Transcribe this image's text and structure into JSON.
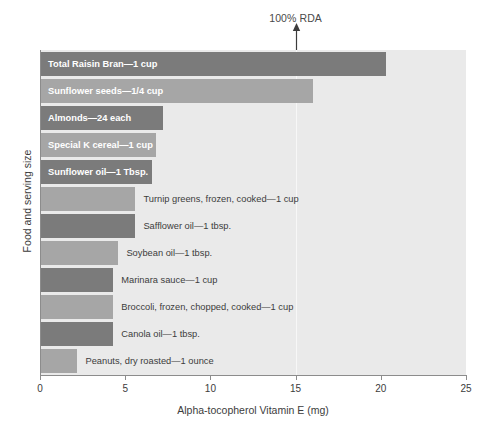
{
  "chart_data": {
    "type": "bar",
    "orientation": "horizontal",
    "title": "",
    "xlabel": "Alpha-tocopherol Vitamin E (mg)",
    "ylabel": "Food and serving size",
    "xlim": [
      0,
      25
    ],
    "xticks": [
      0,
      5,
      10,
      15,
      20,
      25
    ],
    "xtick_labels": [
      "0",
      "5",
      "10",
      "15",
      "20",
      "25"
    ],
    "grid": false,
    "legend": null,
    "annotations": [
      {
        "name": "rda-marker",
        "label": "100% RDA",
        "x": 15,
        "type": "arrow-up-with-reference-line"
      }
    ],
    "categories": [
      "Total Raisin Bran—1 cup",
      "Sunflower seeds—1/4 cup",
      "Almonds—24 each",
      "Special K cereal—1 cup",
      "Sunflower oil—1 Tbsp.",
      "Turnip greens, frozen, cooked—1 cup",
      "Safflower oil—1 tbsp.",
      "Soybean oil—1 tbsp.",
      "Marinara sauce—1 cup",
      "Broccoli, frozen, chopped, cooked—1 cup",
      "Canola oil—1 tbsp.",
      "Peanuts, dry roasted—1 ounce"
    ],
    "values": [
      20.3,
      16.0,
      7.2,
      6.8,
      6.6,
      5.6,
      5.6,
      4.6,
      4.3,
      4.3,
      4.3,
      2.2
    ],
    "bars": [
      {
        "label": "Total Raisin Bran—1 cup",
        "value": 20.3,
        "color": "#7b7b7b",
        "label_position": "inside"
      },
      {
        "label": "Sunflower seeds—1/4 cup",
        "value": 16.0,
        "color": "#a6a6a6",
        "label_position": "inside"
      },
      {
        "label": "Almonds—24 each",
        "value": 7.2,
        "color": "#7b7b7b",
        "label_position": "inside"
      },
      {
        "label": "Special K cereal—1 cup",
        "value": 6.8,
        "color": "#a6a6a6",
        "label_position": "inside"
      },
      {
        "label": "Sunflower oil—1 Tbsp.",
        "value": 6.6,
        "color": "#7b7b7b",
        "label_position": "inside"
      },
      {
        "label": "Turnip greens, frozen, cooked—1 cup",
        "value": 5.6,
        "color": "#a6a6a6",
        "label_position": "outside"
      },
      {
        "label": "Safflower oil—1 tbsp.",
        "value": 5.6,
        "color": "#7b7b7b",
        "label_position": "outside"
      },
      {
        "label": "Soybean oil—1 tbsp.",
        "value": 4.6,
        "color": "#a6a6a6",
        "label_position": "outside"
      },
      {
        "label": "Marinara sauce—1 cup",
        "value": 4.3,
        "color": "#7b7b7b",
        "label_position": "outside"
      },
      {
        "label": "Broccoli, frozen, chopped, cooked—1 cup",
        "value": 4.3,
        "color": "#a6a6a6",
        "label_position": "outside"
      },
      {
        "label": "Canola oil—1 tbsp.",
        "value": 4.3,
        "color": "#7b7b7b",
        "label_position": "outside"
      },
      {
        "label": "Peanuts, dry roasted—1 ounce",
        "value": 2.2,
        "color": "#a6a6a6",
        "label_position": "outside"
      }
    ],
    "colors": {
      "plot_background": "#eaeaea",
      "bar_dark": "#7b7b7b",
      "bar_light": "#a6a6a6",
      "axis": "#8c8c8c",
      "text": "#3c3c3c",
      "inside_label_text": "#ffffff",
      "rda_line": "#f7f7f7"
    }
  }
}
